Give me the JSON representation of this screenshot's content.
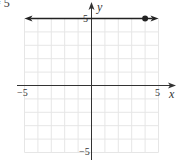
{
  "header": {
    "partial_text": "= 5"
  },
  "chart_data": {
    "type": "line",
    "title": "",
    "equation_fragment": "= 5",
    "xlabel": "x",
    "ylabel": "y",
    "xlim": [
      -5,
      5
    ],
    "ylim": [
      -5,
      5
    ],
    "grid": true,
    "grid_step": 1,
    "x_tick_labels": [
      "-5",
      "5"
    ],
    "y_tick_labels": [
      "5",
      "-5"
    ],
    "series": [
      {
        "name": "horizontal line y = 5",
        "kind": "horizontal-line",
        "y": 5,
        "x": [
          -5,
          5
        ],
        "arrows": "both",
        "color": "#222222"
      }
    ],
    "points": [
      {
        "x": 4,
        "y": 5,
        "style": "filled-dot"
      }
    ]
  },
  "labels": {
    "x_axis": "x",
    "y_axis": "y",
    "x_min": "−5",
    "x_max": "5",
    "y_max": "5",
    "y_min": "−5"
  },
  "colors": {
    "grid": "#e6e6e6",
    "axis": "#333333",
    "line": "#222222"
  }
}
